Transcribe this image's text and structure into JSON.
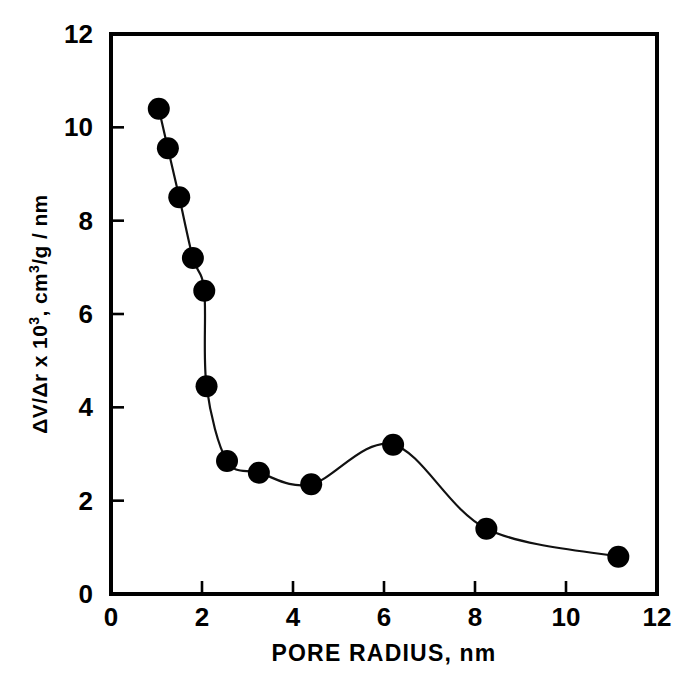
{
  "chart_data": {
    "type": "line",
    "title": "",
    "subtitle": "",
    "xlabel": "PORE RADIUS, nm",
    "ylabel_parts": {
      "pre": "ΔV/Δr  x  10",
      "exp": "3",
      "post": ",  cm",
      "exp2": "3",
      "post2": "/g / nm"
    },
    "ylabel": "ΔV/Δr x 10³, cm³/g/nm",
    "xlim": [
      0,
      12
    ],
    "ylim": [
      0,
      12
    ],
    "xticks": [
      0,
      2,
      4,
      6,
      8,
      10,
      12
    ],
    "yticks": [
      0,
      2,
      4,
      6,
      8,
      10,
      12
    ],
    "xtick_labels": [
      "0",
      "2",
      "4",
      "6",
      "8",
      "10",
      "12"
    ],
    "ytick_labels": [
      "0",
      "2",
      "4",
      "6",
      "8",
      "10",
      "12"
    ],
    "grid": false,
    "legend": null,
    "tick_direction": "in",
    "marker": "filled-circle",
    "marker_color": "#000000",
    "line_color": "#111111",
    "frame_color": "#000000",
    "series": [
      {
        "name": "pore size distribution",
        "x": [
          1.05,
          1.25,
          1.5,
          1.8,
          2.05,
          2.1,
          2.55,
          3.25,
          4.4,
          6.2,
          8.25,
          11.15
        ],
        "y": [
          10.4,
          9.55,
          8.5,
          7.2,
          6.5,
          4.45,
          2.85,
          2.6,
          2.35,
          3.2,
          1.4,
          0.8
        ]
      }
    ]
  },
  "figure": {
    "background": "#ffffff",
    "ink": "#000000"
  }
}
